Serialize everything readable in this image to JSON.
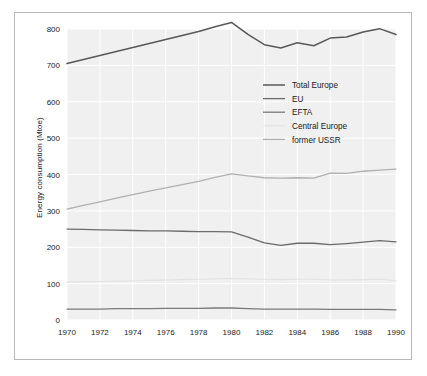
{
  "chart_data": {
    "type": "line",
    "title": "",
    "xlabel": "",
    "ylabel": "Energy consumption (Mtoe)",
    "xlim": [
      1970,
      1990
    ],
    "ylim": [
      0,
      800
    ],
    "grid": true,
    "legend_position": "upper right (inside plot)",
    "xticks": [
      "1970",
      "1972",
      "1974",
      "1976",
      "1978",
      "1980",
      "1982",
      "1984",
      "1986",
      "1988",
      "1990"
    ],
    "yticks": [
      "0",
      "100",
      "200",
      "300",
      "400",
      "500",
      "600",
      "700",
      "800"
    ],
    "x": [
      1970,
      1971,
      1972,
      1973,
      1974,
      1975,
      1976,
      1977,
      1978,
      1979,
      1980,
      1981,
      1982,
      1983,
      1984,
      1985,
      1986,
      1987,
      1988,
      1989,
      1990
    ],
    "series": [
      {
        "name": "Total Europe",
        "color": "#595959",
        "width": 1.5,
        "values": [
          705,
          716,
          727,
          738,
          749,
          760,
          771,
          782,
          793,
          806,
          818,
          785,
          757,
          748,
          762,
          754,
          775,
          778,
          792,
          801,
          785
        ]
      },
      {
        "name": "EU",
        "color": "#6b6b6b",
        "width": 1.3,
        "values": [
          250,
          249,
          248,
          247,
          246,
          245,
          245,
          244,
          243,
          243,
          242,
          228,
          212,
          205,
          211,
          211,
          207,
          210,
          214,
          218,
          215
        ]
      },
      {
        "name": "EFTA",
        "color": "#7a7a7a",
        "width": 1.3,
        "values": [
          30,
          30,
          30,
          31,
          31,
          31,
          32,
          32,
          32,
          33,
          33,
          31,
          30,
          30,
          30,
          30,
          29,
          29,
          29,
          29,
          28
        ]
      },
      {
        "name": "Central Europe",
        "color": "#e2e2e2",
        "width": 1.1,
        "values": [
          104,
          105,
          106,
          107,
          108,
          109,
          110,
          111,
          112,
          113,
          114,
          113,
          112,
          111,
          112,
          112,
          110,
          110,
          111,
          112,
          108
        ]
      },
      {
        "name": "former USSR",
        "color": "#b0b0b0",
        "width": 1.3,
        "values": [
          305,
          315,
          325,
          335,
          345,
          354,
          363,
          372,
          381,
          392,
          402,
          396,
          391,
          390,
          391,
          390,
          404,
          403,
          409,
          412,
          415
        ]
      }
    ]
  },
  "legend": {
    "entries": [
      {
        "label": "Total Europe"
      },
      {
        "label": "EU"
      },
      {
        "label": "EFTA"
      },
      {
        "label": "Central Europe"
      },
      {
        "label": "former USSR"
      }
    ]
  },
  "style": {
    "plot_background": "#f0f0f0",
    "gridline_color": "#ffffff",
    "frame_color": "#b9b9b9",
    "page_background": "#ffffff",
    "text_color": "#1a1a1a"
  }
}
